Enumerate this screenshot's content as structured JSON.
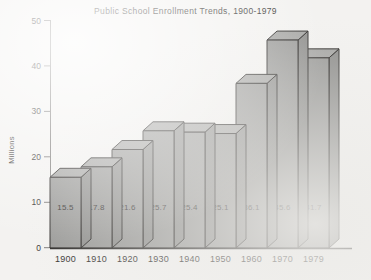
{
  "chart_data": {
    "type": "bar",
    "title": "Public School Enrollment Trends, 1900-1979",
    "xlabel": "",
    "ylabel": "Millions",
    "categories": [
      "1900",
      "1910",
      "1920",
      "1930",
      "1940",
      "1950",
      "1960",
      "1970",
      "1979"
    ],
    "values": [
      15.5,
      17.8,
      21.6,
      25.7,
      25.4,
      25.1,
      36.1,
      45.6,
      41.7
    ],
    "value_labels": [
      "15.5",
      "17.8",
      "21.6",
      "25.7",
      "25.4",
      "25.1",
      "36.1",
      "45.6",
      "41.7"
    ],
    "ylim": [
      0,
      50
    ],
    "yticks": [
      0,
      10,
      20,
      30,
      40,
      50
    ],
    "ytick_labels": [
      "0",
      "10",
      "20",
      "30",
      "40",
      "50"
    ],
    "grid": false,
    "legend": null,
    "style": "3d-isometric-bars",
    "colors": {
      "bar_front": "#9a9a98",
      "bar_top": "#a6a6a4",
      "bar_side": "#8e8e8c",
      "outline": "#2b2927",
      "background": "#f3f2f0",
      "text": "#2e2c2a"
    }
  },
  "axis": {
    "y_title": "Millions"
  }
}
